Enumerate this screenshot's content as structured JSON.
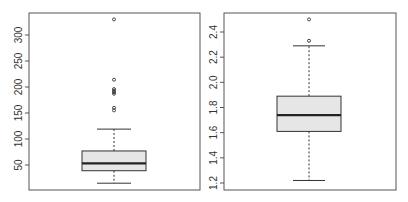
{
  "chart_data": [
    {
      "type": "box",
      "title": "",
      "xlabel": "",
      "ylabel": "",
      "ylim": [
        2,
        340
      ],
      "yticks": [
        50,
        100,
        150,
        200,
        250,
        300
      ],
      "ytick_labels": [
        "50",
        "100",
        "150",
        "200",
        "250",
        "300"
      ],
      "stats": {
        "whisker_low": 15,
        "q1": 39,
        "median": 53,
        "q3": 77,
        "whisker_high": 119
      },
      "outliers": [
        155,
        160,
        187,
        190,
        193,
        196,
        214,
        330
      ],
      "colors": {
        "box_fill": "#e6e6e6",
        "line": "#333333"
      }
    },
    {
      "type": "box",
      "title": "",
      "xlabel": "",
      "ylabel": "",
      "ylim": [
        1.19,
        2.55
      ],
      "yticks": [
        1.2,
        1.4,
        1.6,
        1.8,
        2.0,
        2.2,
        2.4
      ],
      "ytick_labels": [
        "1.2",
        "1.4",
        "1.6",
        "1.8",
        "2.0",
        "2.2",
        "2.4"
      ],
      "stats": {
        "whisker_low": 1.22,
        "q1": 1.61,
        "median": 1.74,
        "q3": 1.89,
        "whisker_high": 2.29
      },
      "outliers": [
        2.33,
        2.5
      ],
      "colors": {
        "box_fill": "#e6e6e6",
        "line": "#333333"
      }
    }
  ]
}
